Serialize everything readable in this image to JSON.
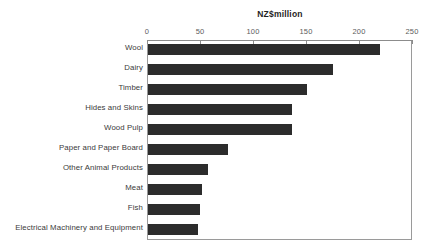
{
  "clipped_caption": "",
  "chart_data": {
    "type": "bar",
    "orientation": "horizontal",
    "title": "",
    "xlabel": "NZ$million",
    "ylabel": "",
    "xlim": [
      0,
      250
    ],
    "ticks": [
      0,
      50,
      100,
      150,
      200,
      250
    ],
    "tick_labels": [
      "0",
      "50",
      "100",
      "150",
      "200",
      "250"
    ],
    "grid": false,
    "legend": null,
    "bar_color": "#2c2c2c",
    "categories": [
      "Wool",
      "Dairy",
      "Timber",
      "Hides and Skins",
      "Wood Pulp",
      "Paper and Paper Board",
      "Other Animal Products",
      "Meat",
      "Fish",
      "Electrical Machinery and Equipment"
    ],
    "values": [
      220,
      175,
      151,
      137,
      137,
      76,
      58,
      52,
      50,
      48
    ]
  }
}
